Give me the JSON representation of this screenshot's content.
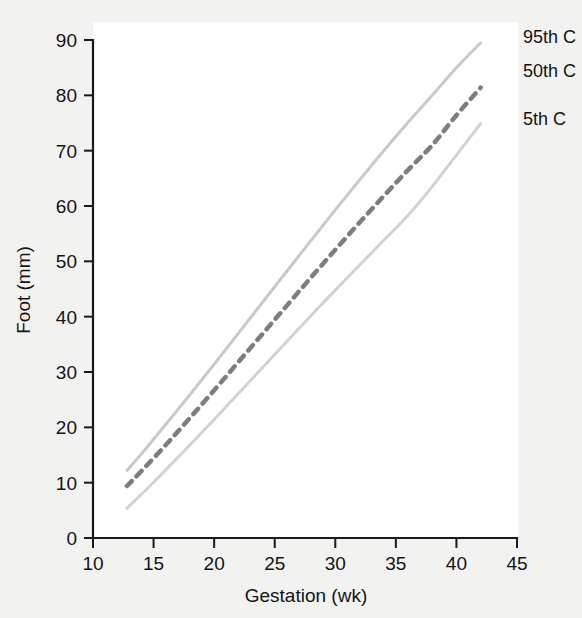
{
  "figure": {
    "background_color": "#f2f2f1",
    "panel_color": "#ffffff"
  },
  "legend": {
    "position": "right",
    "entries": [
      {
        "label": "95th C",
        "color": "#c9c9c9",
        "style": "solid"
      },
      {
        "label": "50th C",
        "color": "#7d7d7d",
        "style": "dashed"
      },
      {
        "label": "5th C",
        "color": "#d2d2d2",
        "style": "solid"
      }
    ]
  },
  "axes": {
    "x": {
      "title": "Gestation (wk)",
      "ticks": [
        10,
        15,
        20,
        25,
        30,
        35,
        40,
        45
      ],
      "min": 10,
      "max": 45
    },
    "y": {
      "title": "Foot (mm)",
      "ticks": [
        0,
        10,
        20,
        30,
        40,
        50,
        60,
        70,
        80,
        90
      ],
      "min": 0,
      "max": 90
    }
  },
  "chart_data": {
    "type": "line",
    "title": "",
    "subtitle": "",
    "xlabel": "Gestation (wk)",
    "ylabel": "Foot (mm)",
    "xlim": [
      10,
      45
    ],
    "ylim": [
      0,
      90
    ],
    "xticks": [
      10,
      15,
      20,
      25,
      30,
      35,
      40,
      45
    ],
    "yticks": [
      0,
      10,
      20,
      30,
      40,
      50,
      60,
      70,
      80,
      90
    ],
    "grid": false,
    "legend_position": "right",
    "x": [
      12.8,
      14,
      16,
      18,
      20,
      22,
      24,
      26,
      28,
      30,
      32,
      34,
      36,
      38,
      40,
      42
    ],
    "series": [
      {
        "name": "95th C",
        "label": "95th C",
        "color": "#c9c9c9",
        "style": "solid",
        "width": 3,
        "values": [
          12.2,
          15.2,
          20.5,
          25.9,
          31.4,
          37.0,
          42.6,
          48.2,
          53.8,
          59.3,
          64.7,
          70.0,
          75.1,
          80.0,
          85.0,
          89.5
        ]
      },
      {
        "name": "50th C",
        "label": "50th C",
        "color": "#7d7d7d",
        "style": "dashed",
        "width": 4.5,
        "values": [
          9.4,
          12.1,
          16.8,
          21.7,
          26.7,
          31.8,
          36.9,
          42.0,
          47.1,
          52.1,
          57.0,
          61.8,
          66.5,
          71.0,
          76.4,
          81.4
        ]
      },
      {
        "name": "5th C",
        "label": "5th C",
        "color": "#d2d2d2",
        "style": "solid",
        "width": 3,
        "values": [
          5.4,
          7.9,
          12.3,
          16.8,
          21.4,
          26.1,
          30.8,
          35.5,
          40.2,
          44.8,
          49.3,
          53.8,
          58.3,
          63.5,
          69.2,
          74.9
        ]
      }
    ]
  }
}
